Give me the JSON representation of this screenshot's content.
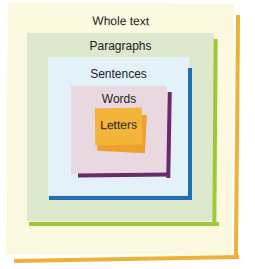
{
  "diagram": {
    "type": "nested-levels",
    "levels": [
      {
        "label": "Whole text",
        "panel_color": "#fbfae0",
        "edge_color": "#eeb23a"
      },
      {
        "label": "Paragraphs",
        "panel_color": "#dde8cc",
        "edge_color": "#9cc83a"
      },
      {
        "label": "Sentences",
        "panel_color": "#e3f1f8",
        "edge_color": "#1f6fb4"
      },
      {
        "label": "Words",
        "panel_color": "#e9d8e0",
        "edge_color": "#6b2a6a"
      },
      {
        "label": "Letters",
        "panel_color": "#f4ae2e",
        "edge_color": "#f0a030"
      }
    ]
  }
}
